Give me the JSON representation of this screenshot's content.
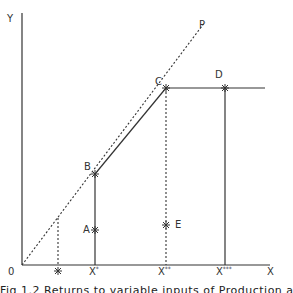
{
  "diagram": {
    "axes": {
      "y_label": "Y",
      "x_label": "X",
      "origin_label": "0"
    },
    "lines": {
      "ray_label": "P"
    },
    "points": {
      "A": "A",
      "B": "B",
      "C": "C",
      "D": "D",
      "E": "E"
    },
    "x_ticks": {
      "x_star": "X",
      "x_star_sup": "*",
      "x_dstar": "X",
      "x_dstar_sup": "**",
      "x_tstar": "X",
      "x_tstar_sup": "***",
      "small_marker": "*"
    },
    "marker_glyph": "✳",
    "colors": {
      "line": "#333333",
      "background": "#ffffff"
    }
  },
  "caption": {
    "text": "Fig 1.2  Returns to variable inputs of Production and Supply Effects"
  }
}
